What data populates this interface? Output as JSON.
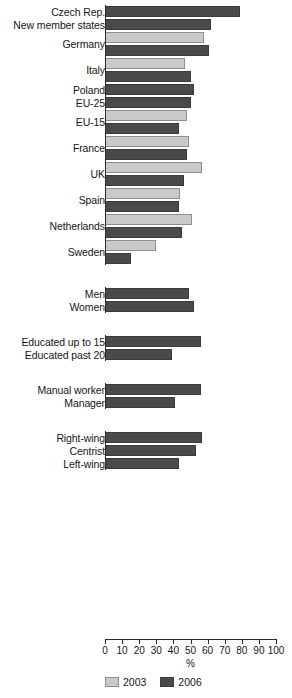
{
  "chart_data": {
    "type": "bar",
    "orientation": "horizontal",
    "title": "",
    "subtitle": "",
    "xlabel": "%",
    "ylabel": "",
    "xlim": [
      0,
      100
    ],
    "xticks": [
      0,
      10,
      20,
      30,
      40,
      50,
      60,
      70,
      80,
      90,
      100
    ],
    "xticklabels": [
      "0",
      "10",
      "20",
      "30",
      "40",
      "50",
      "60",
      "70",
      "80",
      "90",
      "100"
    ],
    "grid": false,
    "legend": {
      "position": "bottom-left",
      "entries": [
        {
          "name": "2003",
          "color": "#c9c9c9"
        },
        {
          "name": "2006",
          "color": "#4a4a4a"
        }
      ]
    },
    "series": [
      {
        "name": "2003",
        "color": "#c9c9c9"
      },
      {
        "name": "2006",
        "color": "#4a4a4a"
      }
    ],
    "groups": [
      {
        "name": "countries",
        "categories": [
          {
            "label": "Czech Rep.",
            "values": {
              "2003": null,
              "2006": 79
            }
          },
          {
            "label": "New member states",
            "values": {
              "2003": null,
              "2006": 62
            }
          },
          {
            "label": "Germany",
            "values": {
              "2003": 58,
              "2006": 61
            }
          },
          {
            "label": "Italy",
            "values": {
              "2003": 47,
              "2006": 50
            }
          },
          {
            "label": "Poland",
            "values": {
              "2003": null,
              "2006": 52
            }
          },
          {
            "label": "EU-25",
            "values": {
              "2003": null,
              "2006": 50
            }
          },
          {
            "label": "EU-15",
            "values": {
              "2003": 48,
              "2006": 43
            }
          },
          {
            "label": "France",
            "values": {
              "2003": 49,
              "2006": 48
            }
          },
          {
            "label": "UK",
            "values": {
              "2003": 57,
              "2006": 46
            }
          },
          {
            "label": "Spain",
            "values": {
              "2003": 44,
              "2006": 43
            }
          },
          {
            "label": "Netherlands",
            "values": {
              "2003": 51,
              "2006": 45
            }
          },
          {
            "label": "Sweden",
            "values": {
              "2003": 30,
              "2006": 15
            }
          }
        ]
      },
      {
        "name": "gender",
        "categories": [
          {
            "label": "Men",
            "values": {
              "2003": null,
              "2006": 49
            }
          },
          {
            "label": "Women",
            "values": {
              "2003": null,
              "2006": 52
            }
          }
        ]
      },
      {
        "name": "education",
        "categories": [
          {
            "label": "Educated up to 15",
            "values": {
              "2003": null,
              "2006": 56
            }
          },
          {
            "label": "Educated past 20",
            "values": {
              "2003": null,
              "2006": 39
            }
          }
        ]
      },
      {
        "name": "occupation",
        "categories": [
          {
            "label": "Manual worker",
            "values": {
              "2003": null,
              "2006": 56
            }
          },
          {
            "label": "Manager",
            "values": {
              "2003": null,
              "2006": 41
            }
          }
        ]
      },
      {
        "name": "politics",
        "categories": [
          {
            "label": "Right-wing",
            "values": {
              "2003": null,
              "2006": 57
            }
          },
          {
            "label": "Centrist",
            "values": {
              "2003": null,
              "2006": 53
            }
          },
          {
            "label": "Left-wing",
            "values": {
              "2003": null,
              "2006": 43
            }
          }
        ]
      }
    ]
  },
  "axis": {
    "x_title": "%"
  }
}
